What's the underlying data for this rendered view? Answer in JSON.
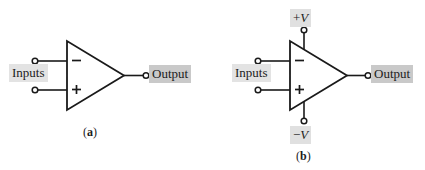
{
  "figure": {
    "background_color": "#ffffff",
    "line_color": "#1a1a1a",
    "label_shade_light": "#e3e3e3",
    "label_shade_dark": "#c9c9c9"
  },
  "panels": [
    {
      "id": "a",
      "caption": "(a)",
      "caption_open_paren": "(",
      "caption_letter": "a",
      "caption_close_paren": ")",
      "inputs_label": "Inputs",
      "output_label": "Output",
      "inverting_symbol": "−",
      "noninverting_symbol": "+",
      "has_power_supply": false
    },
    {
      "id": "b",
      "caption": "(b)",
      "caption_open_paren": "(",
      "caption_letter": "b",
      "caption_close_paren": ")",
      "inputs_label": "Inputs",
      "output_label": "Output",
      "inverting_symbol": "−",
      "noninverting_symbol": "+",
      "has_power_supply": true,
      "positive_supply_sign": "+",
      "positive_supply_symbol": "V",
      "negative_supply_sign": "−",
      "negative_supply_symbol": "V"
    }
  ],
  "icons": {
    "terminal": "terminal-node-icon",
    "triangle": "opamp-triangle-icon"
  }
}
